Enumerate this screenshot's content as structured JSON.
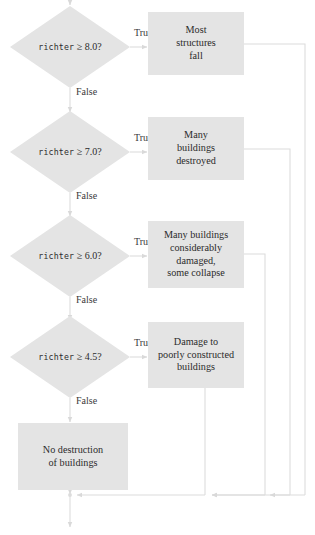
{
  "diagram": {
    "type": "flowchart",
    "colors": {
      "node_fill": "#e4e4e4",
      "line": "#d2d2d2",
      "text": "#2b2b2b"
    },
    "edge_labels": {
      "true": "True",
      "false": "False"
    },
    "decisions": [
      {
        "id": "d1",
        "var": "richter",
        "op": "≥",
        "threshold": "8.0?",
        "true_label": "True",
        "false_label": "False"
      },
      {
        "id": "d2",
        "var": "richter",
        "op": "≥",
        "threshold": "7.0?",
        "true_label": "True",
        "false_label": "False"
      },
      {
        "id": "d3",
        "var": "richter",
        "op": "≥",
        "threshold": "6.0?",
        "true_label": "True",
        "false_label": "False"
      },
      {
        "id": "d4",
        "var": "richter",
        "op": "≥",
        "threshold": "4.5?",
        "true_label": "True",
        "false_label": "False"
      }
    ],
    "outcomes": [
      {
        "id": "o1",
        "lines": [
          "Most",
          "structures",
          "fall"
        ]
      },
      {
        "id": "o2",
        "lines": [
          "Many",
          "buildings",
          "destroyed"
        ]
      },
      {
        "id": "o3",
        "lines": [
          "Many buildings",
          "considerably",
          "damaged,",
          "some collapse"
        ]
      },
      {
        "id": "o4",
        "lines": [
          "Damage to",
          "poorly constructed",
          "buildings"
        ]
      },
      {
        "id": "o5",
        "lines": [
          "No destruction",
          "of buildings"
        ]
      }
    ]
  }
}
